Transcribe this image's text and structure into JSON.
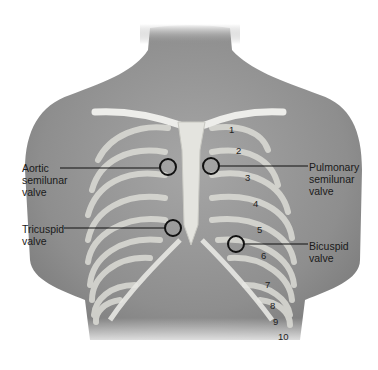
{
  "diagram": {
    "labels": {
      "aortic": "Aortic\nsemilunar\nvalve",
      "pulmonary": "Pulmonary\nsemilunar\nvalve",
      "tricuspid": "Tricuspid\nvalve",
      "bicuspid": "Bicuspid\nvalve"
    },
    "rib_numbers": [
      "1",
      "2",
      "3",
      "4",
      "5",
      "6",
      "7",
      "8",
      "9",
      "10"
    ],
    "colors": {
      "skin": "#9a9a9a",
      "bone": "#e6e6e2",
      "marker": "#111111",
      "text": "#1a1a1a"
    }
  }
}
